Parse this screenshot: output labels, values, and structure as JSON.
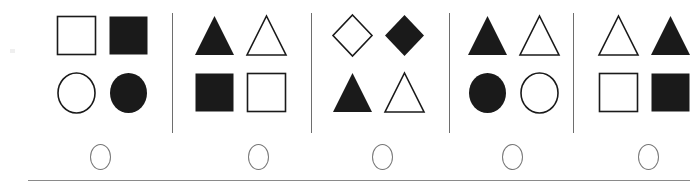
{
  "item": {
    "background_color": "#ffffff",
    "ink_color": "#1a1a1a",
    "rule_color": "#8a8a8a",
    "divider_color": "#6e6e6e",
    "bubble_color": "#777777",
    "panel_count": 5,
    "shapes_per_panel": 4
  },
  "panels": [
    {
      "index": 1,
      "label": "A",
      "shapes": [
        {
          "shape": "square",
          "fill": "outline",
          "position": "top-left"
        },
        {
          "shape": "square",
          "fill": "filled",
          "position": "top-right"
        },
        {
          "shape": "circle",
          "fill": "outline",
          "position": "bottom-left"
        },
        {
          "shape": "circle",
          "fill": "filled",
          "position": "bottom-right"
        }
      ]
    },
    {
      "index": 2,
      "label": "B",
      "shapes": [
        {
          "shape": "triangle",
          "fill": "filled",
          "position": "top-left"
        },
        {
          "shape": "triangle",
          "fill": "outline",
          "position": "top-right"
        },
        {
          "shape": "square",
          "fill": "filled",
          "position": "bottom-left"
        },
        {
          "shape": "square",
          "fill": "outline",
          "position": "bottom-right"
        }
      ]
    },
    {
      "index": 3,
      "label": "C",
      "shapes": [
        {
          "shape": "diamond",
          "fill": "outline",
          "position": "top-left"
        },
        {
          "shape": "diamond",
          "fill": "filled",
          "position": "top-right"
        },
        {
          "shape": "triangle",
          "fill": "filled",
          "position": "bottom-left"
        },
        {
          "shape": "triangle",
          "fill": "outline",
          "position": "bottom-right"
        }
      ]
    },
    {
      "index": 4,
      "label": "D",
      "shapes": [
        {
          "shape": "triangle",
          "fill": "filled",
          "position": "top-left"
        },
        {
          "shape": "triangle",
          "fill": "outline",
          "position": "top-right"
        },
        {
          "shape": "circle",
          "fill": "filled",
          "position": "bottom-left"
        },
        {
          "shape": "circle",
          "fill": "outline",
          "position": "bottom-right"
        }
      ]
    },
    {
      "index": 5,
      "label": "E",
      "shapes": [
        {
          "shape": "triangle",
          "fill": "outline",
          "position": "top-left"
        },
        {
          "shape": "triangle",
          "fill": "filled",
          "position": "top-right"
        },
        {
          "shape": "square",
          "fill": "outline",
          "position": "bottom-left"
        },
        {
          "shape": "square",
          "fill": "filled",
          "position": "bottom-right"
        }
      ]
    }
  ],
  "answer_bubbles": [
    {
      "index": 1,
      "label": "A",
      "selected": false
    },
    {
      "index": 2,
      "label": "B",
      "selected": false
    },
    {
      "index": 3,
      "label": "C",
      "selected": false
    },
    {
      "index": 4,
      "label": "D",
      "selected": false
    },
    {
      "index": 5,
      "label": "E",
      "selected": false
    }
  ],
  "layout": {
    "panel_left_positions": [
      55,
      193,
      331,
      466,
      597
    ],
    "divider_left_positions": [
      172,
      311,
      449,
      573
    ],
    "bubble_left_positions": [
      90,
      248,
      372,
      502,
      638
    ],
    "bottom_rule": {
      "left": 28,
      "top": 180,
      "width": 662
    }
  }
}
